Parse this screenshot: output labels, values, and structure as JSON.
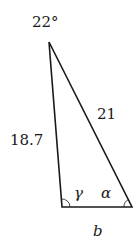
{
  "diagram": {
    "type": "triangle",
    "top_angle": "22°",
    "left_side": "18.7",
    "right_side": "21",
    "bottom_side": "b",
    "bottom_left_angle": "γ",
    "bottom_right_angle": "α",
    "colors": {
      "line": "#1a1a1a",
      "background": "#ffffff"
    }
  }
}
